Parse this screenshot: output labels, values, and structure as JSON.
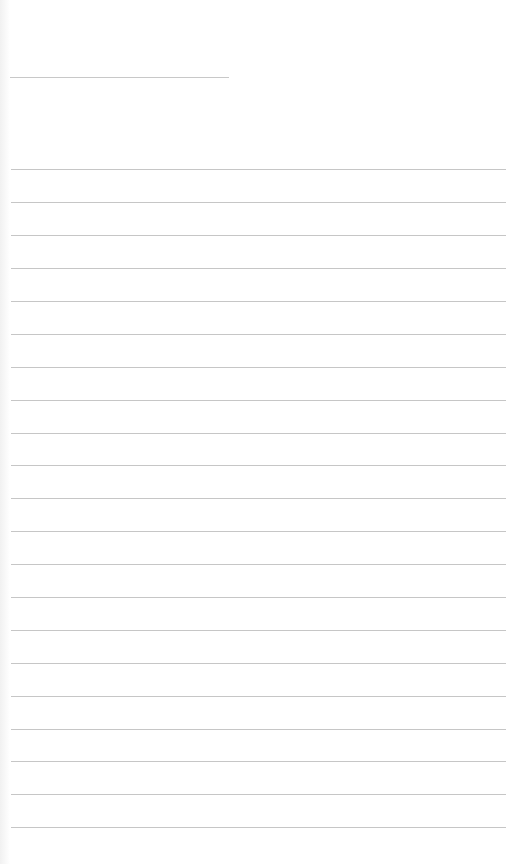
{
  "page": {
    "type": "lined-paper",
    "background_color": "#ffffff",
    "line_color": "#c6c6c6",
    "header_line": {
      "x": 10,
      "y": 77,
      "width": 219
    },
    "ruled_lines": {
      "count": 21,
      "x": 11,
      "width": 495,
      "y_positions": [
        169,
        202,
        235,
        268,
        301,
        334,
        367,
        400,
        433,
        465,
        498,
        531,
        564,
        597,
        630,
        663,
        696,
        729,
        761,
        794,
        827
      ]
    }
  }
}
